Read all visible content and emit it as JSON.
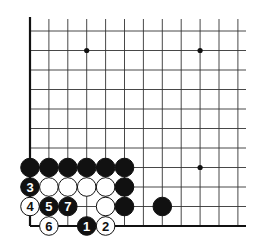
{
  "diagram": {
    "type": "go-board-fragment",
    "grid": {
      "origin_x": 30,
      "origin_y": 31,
      "spacing_x": 18.9,
      "spacing_y": 19.5,
      "cols": 12,
      "rows": 11,
      "right_extent": 246,
      "left_edge_thick": true,
      "bottom_edge_thick": true
    },
    "colors": {
      "line": "#333333",
      "edge": "#111111",
      "black_stone": "#111111",
      "white_stone": "#ffffff",
      "background": "#ffffff"
    },
    "star_points": [
      {
        "col": 3,
        "row": 1
      },
      {
        "col": 9,
        "row": 1
      },
      {
        "col": 9,
        "row": 7
      }
    ],
    "stones": [
      {
        "col": 0,
        "row": 7,
        "color": "black",
        "label": ""
      },
      {
        "col": 1,
        "row": 7,
        "color": "black",
        "label": ""
      },
      {
        "col": 2,
        "row": 7,
        "color": "black",
        "label": ""
      },
      {
        "col": 3,
        "row": 7,
        "color": "black",
        "label": ""
      },
      {
        "col": 4,
        "row": 7,
        "color": "black",
        "label": ""
      },
      {
        "col": 5,
        "row": 7,
        "color": "black",
        "label": ""
      },
      {
        "col": 0,
        "row": 8,
        "color": "black",
        "label": "3"
      },
      {
        "col": 1,
        "row": 8,
        "color": "white",
        "label": ""
      },
      {
        "col": 2,
        "row": 8,
        "color": "white",
        "label": ""
      },
      {
        "col": 3,
        "row": 8,
        "color": "white",
        "label": ""
      },
      {
        "col": 4,
        "row": 8,
        "color": "white",
        "label": ""
      },
      {
        "col": 5,
        "row": 8,
        "color": "black",
        "label": ""
      },
      {
        "col": 0,
        "row": 9,
        "color": "white",
        "label": "4"
      },
      {
        "col": 1,
        "row": 9,
        "color": "black",
        "label": "5"
      },
      {
        "col": 2,
        "row": 9,
        "color": "black",
        "label": "7"
      },
      {
        "col": 4,
        "row": 9,
        "color": "white",
        "label": ""
      },
      {
        "col": 5,
        "row": 9,
        "color": "black",
        "label": ""
      },
      {
        "col": 7,
        "row": 9,
        "color": "black",
        "label": ""
      },
      {
        "col": 1,
        "row": 10,
        "color": "white",
        "label": "6"
      },
      {
        "col": 3,
        "row": 10,
        "color": "black",
        "label": "1"
      },
      {
        "col": 4,
        "row": 10,
        "color": "white",
        "label": "2"
      }
    ]
  }
}
